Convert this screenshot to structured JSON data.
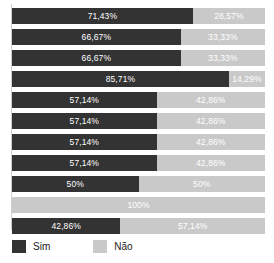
{
  "chart_data": {
    "type": "bar",
    "orientation": "horizontal",
    "stacked": true,
    "stack_total": 100,
    "title": "",
    "subtitle": "",
    "xlabel": "",
    "ylabel": "",
    "xlim": [
      0,
      100
    ],
    "grid": false,
    "categories": [
      "1",
      "2",
      "3",
      "4",
      "5",
      "6",
      "7",
      "8",
      "9",
      "10",
      "11"
    ],
    "series": [
      {
        "name": "Sim",
        "color": "#333333",
        "values": [
          71.43,
          66.67,
          66.67,
          85.71,
          57.14,
          57.14,
          57.14,
          57.14,
          50,
          0,
          42.86
        ],
        "labels": [
          "71,43%",
          "66,67%",
          "66,67%",
          "85,71%",
          "57,14%",
          "57,14%",
          "57,14%",
          "57,14%",
          "50%",
          "",
          "42,86%"
        ]
      },
      {
        "name": "Não",
        "color": "#c9c9c9",
        "values": [
          28.57,
          33.33,
          33.33,
          14.29,
          42.86,
          42.86,
          42.86,
          42.86,
          50,
          100,
          57.14
        ],
        "labels": [
          "28,57%",
          "33,33%",
          "33,33%",
          "14,29%",
          "42,86%",
          "42,86%",
          "42,86%",
          "42,86%",
          "50%",
          "100%",
          "57,14%"
        ]
      }
    ],
    "legend": {
      "position": "bottom-left",
      "entries": [
        {
          "label": "Sim",
          "color": "#333333",
          "swatch": "legend-swatch-sim"
        },
        {
          "label": "Não",
          "color": "#c9c9c9",
          "swatch": "legend-swatch-nao"
        }
      ]
    },
    "rows": [
      {
        "sim_label": "71,43%",
        "sim_value": 71.43,
        "nao_label": "28,57%",
        "nao_value": 28.57
      },
      {
        "sim_label": "66,67%",
        "sim_value": 66.67,
        "nao_label": "33,33%",
        "nao_value": 33.33
      },
      {
        "sim_label": "66,67%",
        "sim_value": 66.67,
        "nao_label": "33,33%",
        "nao_value": 33.33
      },
      {
        "sim_label": "85,71%",
        "sim_value": 85.71,
        "nao_label": "14,29%",
        "nao_value": 14.29
      },
      {
        "sim_label": "57,14%",
        "sim_value": 57.14,
        "nao_label": "42,86%",
        "nao_value": 42.86
      },
      {
        "sim_label": "57,14%",
        "sim_value": 57.14,
        "nao_label": "42,86%",
        "nao_value": 42.86
      },
      {
        "sim_label": "57,14%",
        "sim_value": 57.14,
        "nao_label": "42,86%",
        "nao_value": 42.86
      },
      {
        "sim_label": "57,14%",
        "sim_value": 57.14,
        "nao_label": "42,86%",
        "nao_value": 42.86
      },
      {
        "sim_label": "50%",
        "sim_value": 50,
        "nao_label": "50%",
        "nao_value": 50
      },
      {
        "sim_label": "",
        "sim_value": 0,
        "nao_label": "100%",
        "nao_value": 100
      },
      {
        "sim_label": "42,86%",
        "sim_value": 42.86,
        "nao_label": "57,14%",
        "nao_value": 57.14
      }
    ]
  },
  "colors": {
    "sim": "#333333",
    "nao": "#c9c9c9",
    "label_text": "#ffffff",
    "legend_text": "#1a1a1a",
    "background": "#ffffff",
    "axis": "#d0d0d0"
  }
}
